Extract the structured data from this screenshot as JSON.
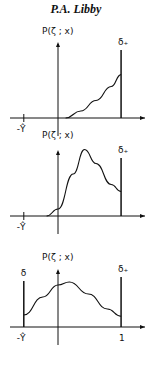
{
  "header": "P.A. Libby",
  "chart_data": [
    {
      "type": "line",
      "ylabel": "P(ζ ; x)",
      "labels": {
        "delta_plus": "δ₊",
        "x_left": "-Ŷ"
      },
      "description": "Monotonically increasing curve starting near 0 to right boundary with delta spike at upper bound",
      "delta_plus": true,
      "delta_minus": false,
      "curve": [
        [
          0.1,
          0
        ],
        [
          0.3,
          0.1
        ],
        [
          0.5,
          0.25
        ],
        [
          0.7,
          0.45
        ],
        [
          0.83,
          0.62
        ]
      ]
    },
    {
      "type": "line",
      "ylabel": "P(ζ ; x)",
      "labels": {
        "delta_plus": "δ₊",
        "x_left": "-Ŷ"
      },
      "description": "Bell-shaped curve with peak in interior, delta spike at upper bound",
      "delta_plus": true,
      "delta_minus": false,
      "curve": [
        [
          -0.15,
          0
        ],
        [
          0,
          0.1
        ],
        [
          0.2,
          0.6
        ],
        [
          0.35,
          0.95
        ],
        [
          0.5,
          0.75
        ],
        [
          0.7,
          0.45
        ],
        [
          0.83,
          0.35
        ]
      ]
    },
    {
      "type": "line",
      "ylabel": "P(ζ ; x)",
      "labels": {
        "delta_plus": "δ₊",
        "delta_minus": "δ",
        "x_left": "-Ŷ",
        "x_right": "1"
      },
      "description": "Broad curve spanning full range with delta spikes at both bounds",
      "delta_plus": true,
      "delta_minus": true,
      "curve": [
        [
          -0.45,
          0.2
        ],
        [
          -0.2,
          0.5
        ],
        [
          0,
          0.7
        ],
        [
          0.15,
          0.75
        ],
        [
          0.4,
          0.55
        ],
        [
          0.65,
          0.3
        ],
        [
          0.83,
          0.18
        ]
      ]
    }
  ]
}
